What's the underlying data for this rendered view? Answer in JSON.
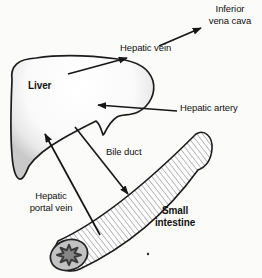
{
  "figure": {
    "kind": "anatomical-diagram"
  },
  "labels": {
    "liver": "Liver",
    "hepatic_vein": "Hepatic vein",
    "inferior_vena_cava_line1": "Inferior",
    "inferior_vena_cava_line2": "vena cava",
    "hepatic_artery": "Hepatic artery",
    "bile_duct": "Bile duct",
    "hepatic_portal_vein_line1": "Hepatic",
    "hepatic_portal_vein_line2": "portal vein",
    "small_intestine_line1": "Small",
    "small_intestine_line2": "intestine"
  },
  "colors": {
    "ink": "#161616",
    "background": "#fbfbf9",
    "outline": "#1c1c1c",
    "liver_edge_shade": "#c9c9c9",
    "intestine_wall": "#c2c2c2",
    "intestine_lumen": "#878787",
    "hatch_line": "#b3b3b3"
  }
}
